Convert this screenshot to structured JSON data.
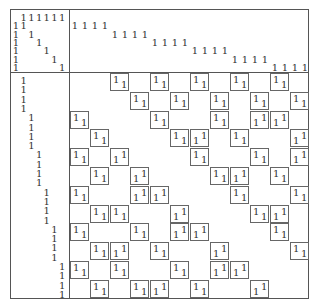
{
  "glyph": "1",
  "top_left": {
    "size": [
      7,
      7
    ],
    "ones": [
      [
        0,
        1
      ],
      [
        0,
        2
      ],
      [
        0,
        3
      ],
      [
        0,
        4
      ],
      [
        0,
        5
      ],
      [
        0,
        6
      ],
      [
        1,
        0
      ],
      [
        1,
        1
      ],
      [
        2,
        0
      ],
      [
        2,
        2
      ],
      [
        3,
        0
      ],
      [
        3,
        3
      ],
      [
        4,
        0
      ],
      [
        4,
        4
      ],
      [
        5,
        0
      ],
      [
        5,
        5
      ],
      [
        6,
        0
      ],
      [
        6,
        6
      ]
    ]
  },
  "top_right": {
    "size": [
      7,
      24
    ],
    "groups": [
      {
        "row": 1,
        "cols": [
          0,
          1,
          2,
          3
        ]
      },
      {
        "row": 2,
        "cols": [
          4,
          5,
          6,
          7
        ]
      },
      {
        "row": 3,
        "cols": [
          8,
          9,
          10,
          11
        ]
      },
      {
        "row": 4,
        "cols": [
          12,
          13,
          14,
          15
        ]
      },
      {
        "row": 5,
        "cols": [
          16,
          17,
          18,
          19
        ]
      },
      {
        "row": 6,
        "cols": [
          20,
          21,
          22,
          23
        ]
      }
    ]
  },
  "bottom_left": {
    "size": [
      24,
      7
    ],
    "groups": [
      {
        "col": 1,
        "rows": [
          0,
          1,
          2,
          3
        ]
      },
      {
        "col": 2,
        "rows": [
          4,
          5,
          6,
          7
        ]
      },
      {
        "col": 3,
        "rows": [
          8,
          9,
          10,
          11
        ]
      },
      {
        "col": 4,
        "rows": [
          12,
          13,
          14,
          15
        ]
      },
      {
        "col": 5,
        "rows": [
          16,
          17,
          18,
          19
        ]
      },
      {
        "col": 6,
        "rows": [
          20,
          21,
          22,
          23
        ]
      }
    ]
  },
  "bottom_right": {
    "block_grid": [
      12,
      12
    ],
    "block_types": {
      "d": "diagonal (top-left & bottom-right)",
      "a": "anti-diagonal (top-right & bottom-left)"
    },
    "rows": [
      [
        [
          2,
          "d"
        ],
        [
          4,
          "d"
        ],
        [
          6,
          "d"
        ],
        [
          8,
          "d"
        ],
        [
          10,
          "d"
        ]
      ],
      [
        [
          3,
          "d"
        ],
        [
          5,
          "d"
        ],
        [
          7,
          "d"
        ],
        [
          9,
          "d"
        ],
        [
          11,
          "d"
        ]
      ],
      [
        [
          0,
          "d"
        ],
        [
          4,
          "d"
        ],
        [
          7,
          "d"
        ],
        [
          9,
          "a"
        ],
        [
          10,
          "a"
        ]
      ],
      [
        [
          1,
          "d"
        ],
        [
          5,
          "d"
        ],
        [
          6,
          "a"
        ],
        [
          8,
          "d"
        ],
        [
          11,
          "a"
        ]
      ],
      [
        [
          0,
          "d"
        ],
        [
          2,
          "a"
        ],
        [
          6,
          "d"
        ],
        [
          9,
          "d"
        ],
        [
          11,
          "a"
        ]
      ],
      [
        [
          1,
          "d"
        ],
        [
          3,
          "a"
        ],
        [
          7,
          "d"
        ],
        [
          8,
          "a"
        ],
        [
          10,
          "d"
        ]
      ],
      [
        [
          0,
          "d"
        ],
        [
          3,
          "a"
        ],
        [
          4,
          "a"
        ],
        [
          8,
          "d"
        ],
        [
          11,
          "d"
        ]
      ],
      [
        [
          1,
          "d"
        ],
        [
          2,
          "d"
        ],
        [
          5,
          "a"
        ],
        [
          9,
          "d"
        ],
        [
          10,
          "a"
        ]
      ],
      [
        [
          0,
          "d"
        ],
        [
          3,
          "d"
        ],
        [
          5,
          "a"
        ],
        [
          6,
          "a"
        ],
        [
          10,
          "d"
        ]
      ],
      [
        [
          1,
          "d"
        ],
        [
          2,
          "a"
        ],
        [
          4,
          "d"
        ],
        [
          7,
          "a"
        ],
        [
          11,
          "d"
        ]
      ],
      [
        [
          0,
          "d"
        ],
        [
          2,
          "d"
        ],
        [
          5,
          "d"
        ],
        [
          7,
          "a"
        ],
        [
          8,
          "a"
        ]
      ],
      [
        [
          1,
          "d"
        ],
        [
          3,
          "d"
        ],
        [
          4,
          "a"
        ],
        [
          6,
          "d"
        ],
        [
          9,
          "a"
        ]
      ]
    ]
  }
}
